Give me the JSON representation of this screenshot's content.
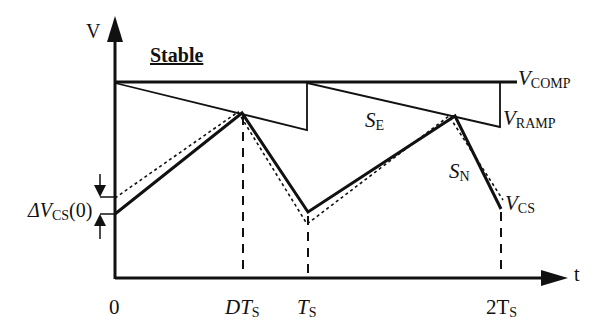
{
  "diagram": {
    "title": "Stable",
    "axes": {
      "y_label": "V",
      "x_label": "t"
    },
    "x_ticks": [
      {
        "main": "0",
        "sub": ""
      },
      {
        "main": "DT",
        "sub": "S"
      },
      {
        "main": "T",
        "sub": "S"
      },
      {
        "main": "2T",
        "sub": "S"
      }
    ],
    "signals": {
      "v_comp": {
        "main": "V",
        "sub": "COMP"
      },
      "v_ramp": {
        "main": "V",
        "sub": "RAMP"
      },
      "v_cs": {
        "main": "V",
        "sub": "CS"
      },
      "s_e": {
        "main": "S",
        "sub": "E"
      },
      "s_n": {
        "main": "S",
        "sub": "N"
      },
      "delta_vcs": {
        "main": "ΔV",
        "sub": "CS",
        "suffix": "(0)"
      }
    },
    "colors": {
      "line": "#111111",
      "background": "#ffffff"
    }
  }
}
